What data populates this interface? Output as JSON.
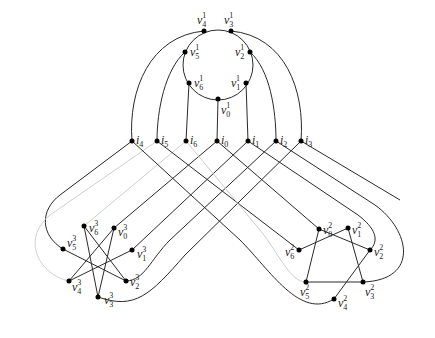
{
  "figure": {
    "colors": {
      "edge": "#2a2a2a",
      "edge_light": "#cfcfcf",
      "vertex": "#000000"
    }
  },
  "top_cycle": {
    "center": [
      218,
      64
    ],
    "radius": 36,
    "vertices": [
      {
        "id": "v1_0",
        "base": "v",
        "sup": "1",
        "sub": "0",
        "x": 218,
        "y": 99,
        "lx": 221,
        "ly": 114
      },
      {
        "id": "v1_1",
        "base": "v",
        "sup": "1",
        "sub": "1",
        "x": 246,
        "y": 83,
        "lx": 231,
        "ly": 87
      },
      {
        "id": "v1_2",
        "base": "v",
        "sup": "1",
        "sub": "2",
        "x": 250,
        "y": 52,
        "lx": 235,
        "ly": 56
      },
      {
        "id": "v1_3",
        "base": "v",
        "sup": "1",
        "sub": "3",
        "x": 231,
        "y": 31,
        "lx": 224,
        "ly": 24
      },
      {
        "id": "v1_4",
        "base": "v",
        "sup": "1",
        "sub": "4",
        "x": 204,
        "y": 31,
        "lx": 197,
        "ly": 24
      },
      {
        "id": "v1_5",
        "base": "v",
        "sup": "1",
        "sub": "5",
        "x": 185,
        "y": 52,
        "lx": 190,
        "ly": 56
      },
      {
        "id": "v1_6",
        "base": "v",
        "sup": "1",
        "sub": "6",
        "x": 189,
        "y": 83,
        "lx": 194,
        "ly": 87
      }
    ]
  },
  "connectors": [
    {
      "id": "i4",
      "base": "i",
      "sub": "4",
      "x": 132,
      "y": 141
    },
    {
      "id": "i5",
      "base": "i",
      "sub": "5",
      "x": 157,
      "y": 141
    },
    {
      "id": "i6",
      "base": "i",
      "sub": "6",
      "x": 186,
      "y": 141
    },
    {
      "id": "i0",
      "base": "i",
      "sub": "0",
      "x": 217,
      "y": 141
    },
    {
      "id": "i1",
      "base": "i",
      "sub": "1",
      "x": 248,
      "y": 141
    },
    {
      "id": "i2",
      "base": "i",
      "sub": "2",
      "x": 276,
      "y": 141
    },
    {
      "id": "i3",
      "base": "i",
      "sub": "3",
      "x": 301,
      "y": 141
    }
  ],
  "left_gadget": {
    "vertices": [
      {
        "id": "v3_0",
        "base": "v",
        "sup": "3",
        "sub": "0",
        "x": 114,
        "y": 228,
        "lx": 118,
        "ly": 236
      },
      {
        "id": "v3_1",
        "base": "v",
        "sup": "3",
        "sub": "1",
        "x": 132,
        "y": 250,
        "lx": 137,
        "ly": 258
      },
      {
        "id": "v3_2",
        "base": "v",
        "sup": "3",
        "sub": "2",
        "x": 126,
        "y": 281,
        "lx": 130,
        "ly": 285
      },
      {
        "id": "v3_3",
        "base": "v",
        "sup": "3",
        "sub": "3",
        "x": 98,
        "y": 297,
        "lx": 104,
        "ly": 304
      },
      {
        "id": "v3_4",
        "base": "v",
        "sup": "3",
        "sub": "4",
        "x": 69,
        "y": 281,
        "lx": 72,
        "ly": 291
      },
      {
        "id": "v3_5",
        "base": "v",
        "sup": "3",
        "sub": "5",
        "x": 63,
        "y": 249,
        "lx": 67,
        "ly": 248
      },
      {
        "id": "v3_6",
        "base": "v",
        "sup": "3",
        "sub": "6",
        "x": 84,
        "y": 226,
        "lx": 89,
        "ly": 232
      }
    ],
    "edges": [
      [
        "v3_0",
        "v3_4"
      ],
      [
        "v3_0",
        "v3_3"
      ],
      [
        "v3_6",
        "v3_3"
      ],
      [
        "v3_6",
        "v3_2"
      ],
      [
        "v3_5",
        "v3_2"
      ],
      [
        "v3_4",
        "v3_1"
      ]
    ]
  },
  "right_gadget": {
    "vertices": [
      {
        "id": "v2_0",
        "base": "v",
        "sup": "2",
        "sub": "0",
        "x": 319,
        "y": 229,
        "lx": 323,
        "ly": 234
      },
      {
        "id": "v2_1",
        "base": "v",
        "sup": "2",
        "sub": "1",
        "x": 348,
        "y": 228,
        "lx": 352,
        "ly": 234
      },
      {
        "id": "v2_2",
        "base": "v",
        "sup": "2",
        "sub": "2",
        "x": 370,
        "y": 250,
        "lx": 374,
        "ly": 256
      },
      {
        "id": "v2_3",
        "base": "v",
        "sup": "2",
        "sub": "3",
        "x": 363,
        "y": 282,
        "lx": 365,
        "ly": 296
      },
      {
        "id": "v2_4",
        "base": "v",
        "sup": "2",
        "sub": "4",
        "x": 334,
        "y": 299,
        "lx": 338,
        "ly": 307
      },
      {
        "id": "v2_5",
        "base": "v",
        "sup": "2",
        "sub": "5",
        "x": 306,
        "y": 282,
        "lx": 300,
        "ly": 296
      },
      {
        "id": "v2_6",
        "base": "v",
        "sup": "2",
        "sub": "6",
        "x": 299,
        "y": 250,
        "lx": 285,
        "ly": 256
      }
    ],
    "edges": [
      [
        "v2_0",
        "v2_2"
      ],
      [
        "v2_0",
        "v2_5"
      ],
      [
        "v2_6",
        "v2_1"
      ],
      [
        "v2_1",
        "v2_3"
      ],
      [
        "v2_5",
        "v2_3"
      ],
      [
        "v2_2",
        "v2_4"
      ]
    ]
  }
}
